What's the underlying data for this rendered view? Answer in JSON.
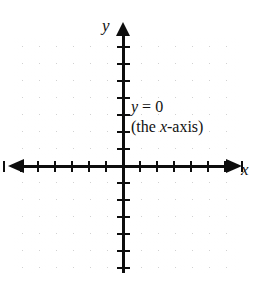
{
  "figure": {
    "background_color": "#ffffff",
    "axis_color": "#0d0d0d",
    "grid_color": "#cfcfcf"
  },
  "axes": {
    "x_label": "x",
    "y_label": "y",
    "x_arrow_left": "arrow-left",
    "x_arrow_right": "arrow-right",
    "y_arrow_up": "arrow-up"
  },
  "annotation": {
    "line1_var": "y",
    "line1_rest": " = 0",
    "line2_open": "(the ",
    "line2_var": "x",
    "line2_rest": "-axis)"
  },
  "chart_data": {
    "type": "line",
    "title": "",
    "xlabel": "x",
    "ylabel": "y",
    "xlim": [
      -7,
      7
    ],
    "ylim": [
      -7,
      7
    ],
    "grid": true,
    "grid_style": "dotted",
    "legend": "none",
    "x_tick_count_negative": 7,
    "x_tick_count_positive": 7,
    "y_tick_count_negative": 7,
    "y_tick_count_positive": 7,
    "tick_labels_shown": false,
    "series": [
      {
        "name": "y = 0",
        "equation": "y = 0",
        "description": "the x-axis",
        "x": [
          -7,
          7
        ],
        "values": [
          0,
          0
        ]
      }
    ],
    "annotations": [
      {
        "text": "y = 0",
        "x": 0.6,
        "y": 3.9
      },
      {
        "text": "(the x-axis)",
        "x": 0.6,
        "y": 2.7
      }
    ]
  }
}
